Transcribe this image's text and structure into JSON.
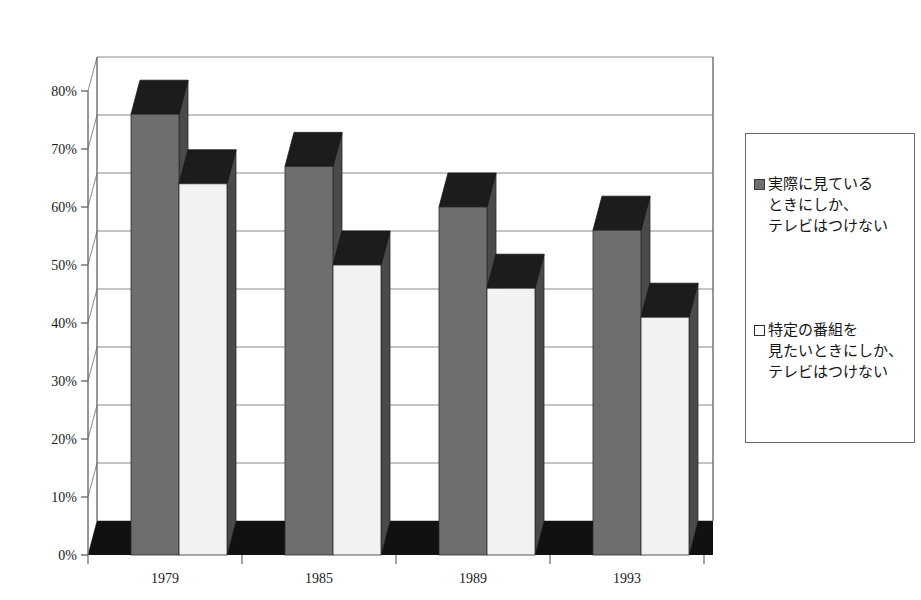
{
  "chart_data": {
    "type": "bar",
    "title": "",
    "xlabel": "",
    "ylabel": "",
    "categories": [
      "1979",
      "1985",
      "1989",
      "1993"
    ],
    "ylim": [
      0,
      80
    ],
    "ytick_labels": [
      "0%",
      "10%",
      "20%",
      "30%",
      "40%",
      "50%",
      "60%",
      "70%",
      "80%"
    ],
    "ytick_values": [
      0,
      10,
      20,
      30,
      40,
      50,
      60,
      70,
      80
    ],
    "grid": true,
    "legend_position": "right",
    "three_d": true,
    "series": [
      {
        "name": "実際に見ているときにしか、テレビはつけない",
        "legend_lines": "実際に見ている\nときにしか、\nテレビはつけない",
        "color": "#6e6e6e",
        "values": [
          76,
          67,
          60,
          56
        ]
      },
      {
        "name": "特定の番組を見たいときにしか、テレビはつけない",
        "legend_lines": "特定の番組を\n見たいときにしか、\nテレビはつけない",
        "color": "#f2f2f0",
        "values": [
          64,
          50,
          46,
          41
        ]
      }
    ]
  },
  "colors": {
    "series_dark": "#6e6e6e",
    "series_light": "#f2f2f0",
    "bar_top_dark": "#1c1c1c",
    "bar_side_dark": "#4a4a4a",
    "floor": "#111111",
    "gridline": "#8a8a8a",
    "axis": "#6a6a6a",
    "text": "#141414"
  }
}
